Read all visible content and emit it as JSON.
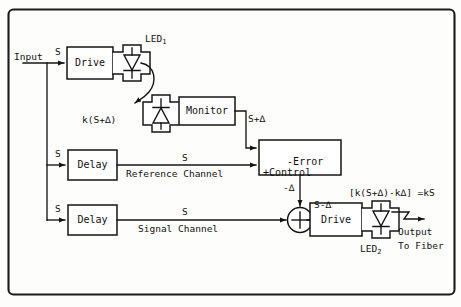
{
  "figure": {
    "type": "block-diagram",
    "frame": {
      "shape": "rounded-rectangle",
      "color": "#1b1b1b"
    },
    "background": "#fdfdfb",
    "stroke_color": "#151515"
  },
  "blocks": [
    {
      "id": "drive-1",
      "label": "Drive",
      "x": 67,
      "y": 47,
      "w": 46,
      "h": 32
    },
    {
      "id": "monitor",
      "label": "Monitor",
      "x": 179,
      "y": 97,
      "w": 56,
      "h": 28
    },
    {
      "id": "error-control",
      "label": "-Error\n+Control",
      "x": 259,
      "y": 140,
      "w": 82,
      "h": 35
    },
    {
      "id": "delay-ref",
      "label": "Delay",
      "x": 68,
      "y": 150,
      "w": 49,
      "h": 30
    },
    {
      "id": "delay-sig",
      "label": "Delay",
      "x": 68,
      "y": 205,
      "w": 49,
      "h": 30
    },
    {
      "id": "drive-2",
      "label": "Drive",
      "x": 310,
      "y": 203,
      "w": 52,
      "h": 33
    }
  ],
  "components": [
    {
      "id": "led-1",
      "name": "LED",
      "subscript": "1",
      "orientation": "down",
      "kind": "emitter"
    },
    {
      "id": "photodiode",
      "name": "",
      "subscript": "",
      "orientation": "up",
      "kind": "detector"
    },
    {
      "id": "led-2",
      "name": "LED",
      "subscript": "2",
      "orientation": "down",
      "kind": "emitter"
    },
    {
      "id": "summing-junction",
      "name": "+",
      "kind": "summer"
    }
  ],
  "labels": {
    "input": "Input",
    "signal_s_top": "S",
    "signal_s_ref": "S",
    "signal_s_sig": "S",
    "led1": "LED",
    "led1_sub": "1",
    "led2": "LED",
    "led2_sub": "2",
    "k_s_plus_delta": "k(S+∆)",
    "s_plus_delta": "S+∆",
    "error_control": "-Error\n+Control",
    "minus_delta": "-∆",
    "s_minus_delta": "S-∆",
    "reference_channel_s": "S",
    "reference_channel": "Reference Channel",
    "signal_channel_s": "S",
    "signal_channel": "Signal Channel",
    "equation": "[k(S+∆)-k∆] =kS",
    "output": "Output",
    "to_fiber": "To Fiber",
    "drive": "Drive",
    "monitor": "Monitor",
    "delay": "Delay"
  },
  "equation_detail": {
    "open_bracket": "[",
    "term_1": "k(S+∆)",
    "minus": "-",
    "term_2": "k∆",
    "close_bracket": "]",
    "equals": " =kS"
  }
}
